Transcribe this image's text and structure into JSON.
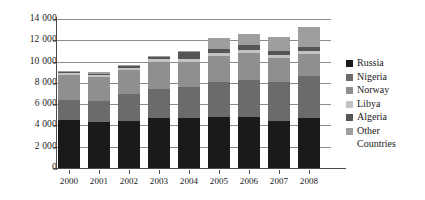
{
  "chart_data": {
    "type": "bar",
    "stacked": true,
    "title": "",
    "subtitle": "",
    "xlabel": "",
    "ylabel": "",
    "categories": [
      "2000",
      "2001",
      "2002",
      "2003",
      "2004",
      "2005",
      "2006",
      "2007",
      "2008"
    ],
    "ylim": [
      0,
      14000
    ],
    "yticks": [
      0,
      2000,
      4000,
      6000,
      8000,
      10000,
      12000,
      14000
    ],
    "ytick_labels": [
      "0",
      "2 000",
      "4 000",
      "6 000",
      "8 000",
      "10 000",
      "12 000",
      "14 000"
    ],
    "grid": true,
    "grid_axis": "y",
    "legend_position": "right",
    "series": [
      {
        "name": "Russia",
        "color": "#1a1a1a",
        "values": [
          4500,
          4280,
          4380,
          4720,
          4700,
          4800,
          4760,
          4400,
          4720
        ]
      },
      {
        "name": "Nigeria",
        "color": "#6b6b6b",
        "values": [
          1900,
          2030,
          2600,
          2750,
          2880,
          3300,
          3500,
          3650,
          3900
        ]
      },
      {
        "name": "Norway",
        "color": "#8f8f8f",
        "values": [
          2320,
          2280,
          2250,
          2500,
          2350,
          2400,
          2550,
          2250,
          2050
        ]
      },
      {
        "name": "Libya",
        "color": "#c3c3c3",
        "values": [
          200,
          180,
          200,
          250,
          300,
          300,
          320,
          280,
          300
        ]
      },
      {
        "name": "Algeria",
        "color": "#555555",
        "values": [
          120,
          110,
          150,
          180,
          680,
          420,
          450,
          420,
          400
        ]
      },
      {
        "name": "Other Countries",
        "color": "#9e9e9e",
        "values": [
          110,
          120,
          120,
          170,
          90,
          980,
          1020,
          1320,
          1930
        ]
      }
    ],
    "totals": [
      9150,
      9000,
      9700,
      10570,
      11000,
      12200,
      12600,
      12320,
      13300
    ]
  },
  "legend": {
    "items": [
      {
        "label": "Russia",
        "label2": ""
      },
      {
        "label": "Nigeria",
        "label2": ""
      },
      {
        "label": "Norway",
        "label2": ""
      },
      {
        "label": "Libya",
        "label2": ""
      },
      {
        "label": "Algeria",
        "label2": ""
      },
      {
        "label": "Other",
        "label2": "Countries"
      }
    ]
  },
  "colors": {
    "background": "#ffffff",
    "axis": "#4a4a4a",
    "gridline": "#8c8c8c",
    "text": "#1a1a1a"
  }
}
